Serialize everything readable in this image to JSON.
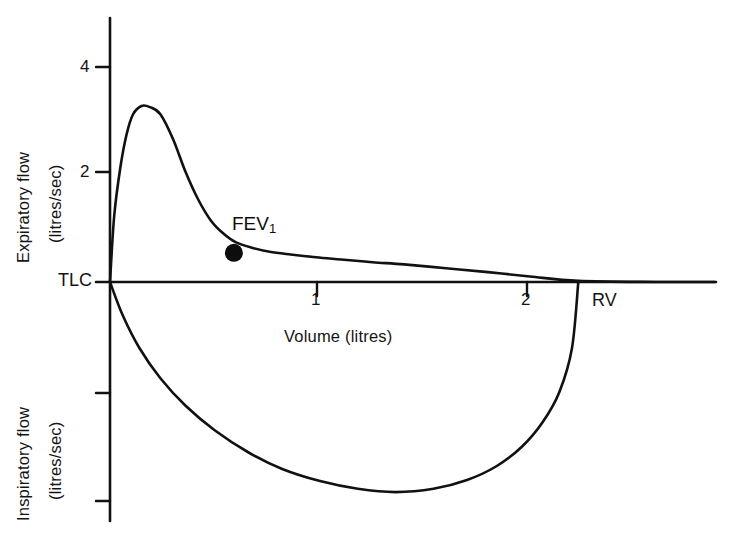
{
  "figure": {
    "background_color": "#ffffff",
    "stroke_color": "#111111"
  },
  "axes": {
    "upper_y_title_line1": "Expiratory flow",
    "upper_y_title_line2": "(litres/sec)",
    "lower_y_title_line1": "Inspiratory flow",
    "lower_y_title_line2": "(litres/sec)",
    "x_title": "Volume (litres)",
    "y_ticks_upper": [
      "2",
      "4"
    ],
    "x_ticks": [
      "1",
      "2"
    ]
  },
  "annotations": {
    "tlc_label": "TLC",
    "rv_label": "RV",
    "fev1_label": "FEV",
    "fev1_subscript": "1"
  },
  "chart_data": {
    "type": "line",
    "title": "",
    "xlabel": "Volume (litres)",
    "ylabel": "Expiratory flow (litres/sec) / Inspiratory flow (litres/sec)",
    "xlim": [
      0,
      2.9
    ],
    "ylim": [
      -4.4,
      4.8
    ],
    "xticks": [
      1,
      2
    ],
    "yticks": [
      2,
      4
    ],
    "grid": false,
    "legend": null,
    "annotations": [
      {
        "text": "TLC",
        "x": 0,
        "y": 0,
        "meaning": "total lung capacity, start of forced expiration"
      },
      {
        "text": "RV",
        "x": 2.23,
        "y": 0,
        "meaning": "residual volume, end of forced expiration"
      },
      {
        "text": "FEV1",
        "x": 0.59,
        "y": 0.53,
        "meaning": "volume expired in first second",
        "marker": "filled-circle"
      }
    ],
    "series": [
      {
        "name": "Expiratory flow (maximum expiratory flow-volume curve)",
        "x": [
          0.0,
          0.02,
          0.05,
          0.08,
          0.11,
          0.15,
          0.19,
          0.24,
          0.3,
          0.36,
          0.42,
          0.48,
          0.54,
          0.6,
          0.68,
          0.76,
          0.86,
          0.98,
          1.1,
          1.25,
          1.4,
          1.6,
          1.8,
          2.0,
          2.23,
          2.6,
          2.88
        ],
        "y": [
          0.0,
          1.2,
          2.1,
          2.7,
          3.05,
          3.2,
          3.18,
          3.05,
          2.6,
          2.0,
          1.5,
          1.12,
          0.88,
          0.72,
          0.62,
          0.55,
          0.5,
          0.45,
          0.41,
          0.36,
          0.32,
          0.25,
          0.18,
          0.1,
          0.02,
          0.0,
          0.0
        ]
      },
      {
        "name": "Inspiratory flow (maximum inspiratory flow-volume curve)",
        "x": [
          0.0,
          0.06,
          0.14,
          0.24,
          0.36,
          0.5,
          0.66,
          0.82,
          1.0,
          1.18,
          1.36,
          1.54,
          1.7,
          1.84,
          1.96,
          2.06,
          2.14,
          2.2,
          2.23
        ],
        "y": [
          0.0,
          -0.6,
          -1.2,
          -1.75,
          -2.25,
          -2.7,
          -3.1,
          -3.4,
          -3.62,
          -3.76,
          -3.82,
          -3.76,
          -3.6,
          -3.35,
          -3.0,
          -2.55,
          -2.0,
          -1.2,
          0.0
        ]
      }
    ]
  }
}
